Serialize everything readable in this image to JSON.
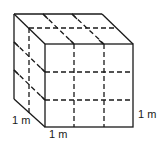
{
  "figure": {
    "stroke_color": "#1a1a1a",
    "background": "#ffffff"
  },
  "labels": {
    "left_edge": "1 m",
    "bottom_edge": "1 m",
    "right_edge": "1 m"
  }
}
